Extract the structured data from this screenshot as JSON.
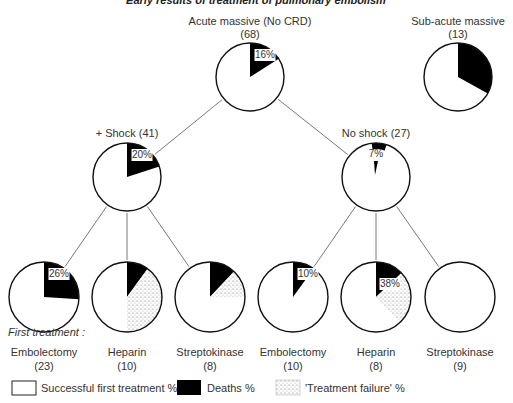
{
  "chart_data": {
    "type": "pie",
    "title": "Early results of treatment of pulmonary embolism",
    "colors": {
      "success": "#ffffff",
      "deaths": "#000000",
      "failure": "stipple",
      "outline": "#111111",
      "lines": "#555555"
    },
    "legend": {
      "success": "Successful first treatment %",
      "deaths": "Deaths %",
      "failure": "'Treatment failure' %"
    },
    "first_treatment_label": "First treatment :",
    "nodes": [
      {
        "id": "acute",
        "label": "Acute massive (No CRD)",
        "n": "(68)",
        "deaths_pct": 16,
        "failure_pct": 0,
        "pct_label": "16%",
        "cx": 250,
        "cy": 77,
        "r": 34
      },
      {
        "id": "subacute",
        "label": "Sub-acute massive",
        "n": "(13)",
        "deaths_pct": 33,
        "failure_pct": 0,
        "pct_label": "",
        "cx": 458,
        "cy": 77,
        "r": 34
      },
      {
        "id": "shock",
        "label": "+ Shock (41)",
        "n": "",
        "deaths_pct": 20,
        "failure_pct": 0,
        "pct_label": "20%",
        "cx": 127,
        "cy": 177,
        "r": 34
      },
      {
        "id": "noshock",
        "label": "No shock (27)",
        "n": "",
        "deaths_pct": 7,
        "failure_pct": 0,
        "pct_label": "7%",
        "cx": 376,
        "cy": 177,
        "r": 34
      },
      {
        "id": "shock-embolectomy",
        "label": "Embolectomy",
        "n": "(23)",
        "deaths_pct": 26,
        "failure_pct": 0,
        "pct_label": "26%",
        "cx": 44,
        "cy": 297,
        "r": 35
      },
      {
        "id": "shock-heparin",
        "label": "Heparin",
        "n": "(10)",
        "deaths_pct": 10,
        "failure_pct": 40,
        "pct_label": "",
        "cx": 127,
        "cy": 297,
        "r": 35
      },
      {
        "id": "shock-streptokinase",
        "label": "Streptokinase",
        "n": "(8)",
        "deaths_pct": 12,
        "failure_pct": 13,
        "pct_label": "",
        "cx": 210,
        "cy": 297,
        "r": 35
      },
      {
        "id": "noshock-embolectomy",
        "label": "Embolectomy",
        "n": "(10)",
        "deaths_pct": 10,
        "failure_pct": 0,
        "pct_label": "10%",
        "cx": 293,
        "cy": 297,
        "r": 35
      },
      {
        "id": "noshock-heparin",
        "label": "Heparin",
        "n": "(8)",
        "deaths_pct": 13,
        "failure_pct": 25,
        "pct_label": "38%",
        "cx": 376,
        "cy": 297,
        "r": 35
      },
      {
        "id": "noshock-streptokinase",
        "label": "Streptokinase",
        "n": "(9)",
        "deaths_pct": 0,
        "failure_pct": 0,
        "pct_label": "",
        "cx": 460,
        "cy": 297,
        "r": 35
      }
    ],
    "edges": [
      [
        "acute",
        "shock"
      ],
      [
        "acute",
        "noshock"
      ],
      [
        "shock",
        "shock-embolectomy"
      ],
      [
        "shock",
        "shock-heparin"
      ],
      [
        "shock",
        "shock-streptokinase"
      ],
      [
        "noshock",
        "noshock-embolectomy"
      ],
      [
        "noshock",
        "noshock-heparin"
      ],
      [
        "noshock",
        "noshock-streptokinase"
      ]
    ]
  }
}
